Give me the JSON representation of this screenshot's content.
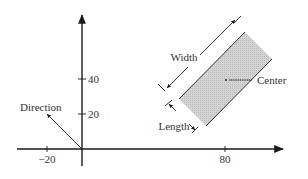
{
  "diagram": {
    "x_axis": {
      "ticks": [
        {
          "label": "−20",
          "value": -20
        },
        {
          "label": "80",
          "value": 80
        }
      ]
    },
    "y_axis": {
      "ticks": [
        {
          "label": "20",
          "value": 20
        },
        {
          "label": "40",
          "value": 40
        }
      ]
    },
    "labels": {
      "direction": "Direction",
      "width": "Width",
      "length": "Length",
      "center": "Center"
    },
    "colors": {
      "rectangle_fill": "#cfcfcf",
      "stroke": "#1a1a1a",
      "text": "#333333"
    }
  }
}
